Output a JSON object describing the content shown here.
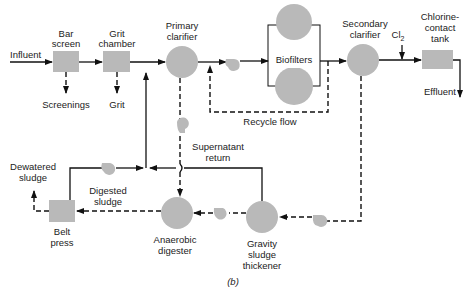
{
  "diagram": {
    "type": "wastewater treatment process flow diagram",
    "caption": "(b)",
    "units": {
      "influent": "Influent",
      "bar_screen": [
        "Bar",
        "screen"
      ],
      "grit_chamber": [
        "Grit",
        "chamber"
      ],
      "primary_clarifier": [
        "Primary",
        "clarifier"
      ],
      "biofilters": "Biofilters",
      "secondary_clarifier": [
        "Secondary",
        "clarifier"
      ],
      "chlorine_tank": [
        "Chlorine-",
        "contact",
        "tank"
      ],
      "cl2": "Cl",
      "cl2_sub": "2",
      "effluent": "Effluent",
      "screenings": "Screenings",
      "grit": "Grit",
      "recycle_flow": "Recycle flow",
      "supernatant": [
        "Supernatant",
        "return"
      ],
      "dewatered_sludge": [
        "Dewatered",
        "sludge"
      ],
      "digested_sludge": [
        "Digested",
        "sludge"
      ],
      "belt_press": [
        "Belt",
        "press"
      ],
      "anaerobic_digester": [
        "Anaerobic",
        "digester"
      ],
      "gravity_thickener": [
        "Gravity",
        "sludge",
        "thickener"
      ]
    },
    "legend": {
      "solid_line": "liquid flow",
      "dashed_line": "sludge flow"
    },
    "colors": {
      "unit_fill": "#b9b9b9",
      "line": "#111111"
    }
  }
}
